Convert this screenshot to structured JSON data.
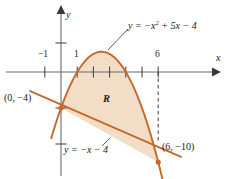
{
  "figure": {
    "axes": {
      "x_axis_name": "x",
      "y_axis_name": "y",
      "x_tick_labels": [
        "−1",
        "1",
        "6"
      ],
      "origin_px": [
        61,
        72
      ],
      "x_scale_px_per_unit": 16.2,
      "y_scale_px_per_unit": 9.0
    },
    "curves": {
      "parabola_label_prefix": "y = −x",
      "parabola_label_exponent": "2",
      "parabola_label_suffix": " + 5x − 4",
      "line_label": "y = −x − 4"
    },
    "points": {
      "left_intersection": "(0, −4)",
      "right_intersection": "(6, −10)"
    },
    "region_label": "R",
    "colors": {
      "curve_stroke": "#c4692a",
      "region_fill": "#f2ddc6",
      "axis_stroke": "#6b6b6b",
      "text": "#1a1a1a"
    }
  },
  "chart_data": {
    "type": "line",
    "title": "",
    "xlabel": "x",
    "ylabel": "y",
    "xlim": [
      -2.2,
      8.2
    ],
    "ylim": [
      -13.5,
      5.5
    ],
    "grid": false,
    "legend": "none",
    "series": [
      {
        "name": "y = -x^2 + 5x - 4",
        "type": "parabola",
        "coefficients": {
          "a": -1,
          "b": 5,
          "c": -4
        },
        "roots": [
          1,
          4
        ],
        "vertex": [
          2.5,
          2.25
        ],
        "x_domain": [
          -0.6,
          6.6
        ],
        "points": [
          [
            -0.5,
            -6.75
          ],
          [
            0,
            -4
          ],
          [
            0.5,
            -1.75
          ],
          [
            1,
            0
          ],
          [
            1.5,
            1.25
          ],
          [
            2,
            2
          ],
          [
            2.5,
            2.25
          ],
          [
            3,
            2
          ],
          [
            3.5,
            1.25
          ],
          [
            4,
            0
          ],
          [
            4.5,
            -1.75
          ],
          [
            5,
            -4
          ],
          [
            5.5,
            -6.75
          ],
          [
            6,
            -10
          ],
          [
            6.5,
            -13.75
          ]
        ]
      },
      {
        "name": "y = -x - 4",
        "type": "line",
        "slope": -1,
        "intercept": -4,
        "x_domain": [
          -1.9,
          7.4
        ],
        "points": [
          [
            -1.9,
            -2.1
          ],
          [
            0,
            -4
          ],
          [
            6,
            -10
          ],
          [
            7.4,
            -11.4
          ]
        ]
      }
    ],
    "shaded_region": {
      "label": "R",
      "between": [
        "y = -x^2 + 5x - 4",
        "y = -x - 4"
      ],
      "x_from": 0,
      "x_to": 6
    },
    "annotations": [
      {
        "text": "(0, -4)",
        "x": 0,
        "y": -4
      },
      {
        "text": "(6, -10)",
        "x": 6,
        "y": -10
      }
    ],
    "xticks": [
      -1,
      1,
      2,
      3,
      4,
      5,
      6
    ],
    "xtick_labels_shown": [
      -1,
      1,
      6
    ]
  }
}
